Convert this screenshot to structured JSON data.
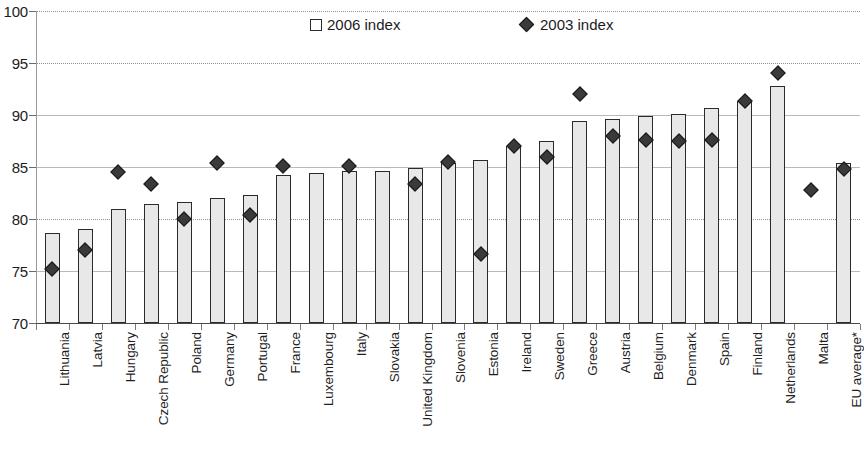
{
  "legend": {
    "position": "top-center",
    "entries": [
      {
        "label": "2006 index",
        "marker": "square-outline-icon",
        "color": "#ffffff"
      },
      {
        "label": "2003 index",
        "marker": "diamond-filled-icon",
        "color": "#3a3a3a"
      }
    ]
  },
  "axis": {
    "y_ticks": [
      70,
      75,
      80,
      85,
      90,
      95,
      100
    ],
    "y_min": 70,
    "y_max": 100
  },
  "colors": {
    "bar_fill": "#e8e8e8",
    "bar_stroke": "#2b2b2b",
    "diamond_fill": "#3a3a3a",
    "gridline": "#b9b9b9",
    "axis": "#4a4a4a",
    "text": "#1c1c1c"
  },
  "chart_data": {
    "type": "bar",
    "title": "",
    "subtitle": "",
    "xlabel": "",
    "ylabel": "",
    "ylim": [
      70,
      100
    ],
    "yticks": [
      70,
      75,
      80,
      85,
      90,
      95,
      100
    ],
    "grid": true,
    "legend_position": "top-center",
    "categories": [
      "Lithuania",
      "Latvia",
      "Hungary",
      "Czech Republic",
      "Poland",
      "Germany",
      "Portugal",
      "France",
      "Luxembourg",
      "Italy",
      "Slovakia",
      "United Kingdom",
      "Slovenia",
      "Estonia",
      "Ireland",
      "Sweden",
      "Greece",
      "Austria",
      "Belgium",
      "Denmark",
      "Spain",
      "Finland",
      "Netherlands",
      "Malta",
      "EU average*"
    ],
    "series": [
      {
        "name": "2006 index",
        "type": "bar",
        "values": [
          78.7,
          79.0,
          81.0,
          81.4,
          81.6,
          82.0,
          82.3,
          84.2,
          84.4,
          84.6,
          84.6,
          84.9,
          85.4,
          85.7,
          87.0,
          87.5,
          89.4,
          89.6,
          89.9,
          90.1,
          90.7,
          91.3,
          92.8,
          null,
          85.4
        ]
      },
      {
        "name": "2003 index",
        "type": "scatter",
        "values": [
          75.2,
          77.0,
          84.5,
          83.4,
          80.0,
          85.4,
          80.4,
          85.1,
          null,
          85.1,
          null,
          83.4,
          85.5,
          76.6,
          87.0,
          86.0,
          92.0,
          88.0,
          87.6,
          87.5,
          87.6,
          91.3,
          94.0,
          82.8,
          84.8
        ]
      }
    ]
  }
}
